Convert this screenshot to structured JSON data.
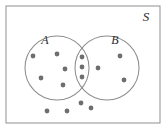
{
  "figure": {
    "type": "venn-diagram",
    "universe_label": "S",
    "set_a_label": "A",
    "set_b_label": "B",
    "background_color": "#ffffff",
    "stroke_color": "#8c8c8c",
    "dot_color": "#6e6e6e",
    "label_color": "#2b2b2b"
  },
  "universe_rect": {
    "x": 6,
    "y": 6,
    "width": 154,
    "height": 117
  },
  "circles": [
    {
      "name": "A",
      "cx": 57,
      "cy": 68,
      "r": 32
    },
    {
      "name": "B",
      "cx": 107,
      "cy": 68,
      "r": 32
    }
  ],
  "labels": [
    {
      "name": "S",
      "text": "S",
      "x": 146,
      "y": 21,
      "size": 13
    },
    {
      "name": "A",
      "text": "A",
      "x": 45,
      "y": 44,
      "size": 12
    },
    {
      "name": "B",
      "text": "B",
      "x": 115,
      "y": 44,
      "size": 12
    }
  ],
  "chart_data": {
    "type": "scatter",
    "title": "",
    "counts": {
      "A_only": 5,
      "B_only": 3,
      "A_and_B": 3,
      "outside": 4,
      "total": 15
    },
    "points": [
      {
        "region": "A_only",
        "x": 33,
        "y": 56
      },
      {
        "region": "A_only",
        "x": 57,
        "y": 54
      },
      {
        "region": "A_only",
        "x": 65,
        "y": 69
      },
      {
        "region": "A_only",
        "x": 41,
        "y": 78
      },
      {
        "region": "A_only",
        "x": 63,
        "y": 85
      },
      {
        "region": "A_and_B",
        "x": 82,
        "y": 57
      },
      {
        "region": "A_and_B",
        "x": 82,
        "y": 67
      },
      {
        "region": "A_and_B",
        "x": 82,
        "y": 77
      },
      {
        "region": "B_only",
        "x": 120,
        "y": 56
      },
      {
        "region": "B_only",
        "x": 98,
        "y": 68
      },
      {
        "region": "B_only",
        "x": 124,
        "y": 80
      },
      {
        "region": "outside",
        "x": 81,
        "y": 103
      },
      {
        "region": "outside",
        "x": 47,
        "y": 111
      },
      {
        "region": "outside",
        "x": 67,
        "y": 111
      },
      {
        "region": "outside",
        "x": 91,
        "y": 108
      }
    ],
    "dot_radius": 2.4
  }
}
